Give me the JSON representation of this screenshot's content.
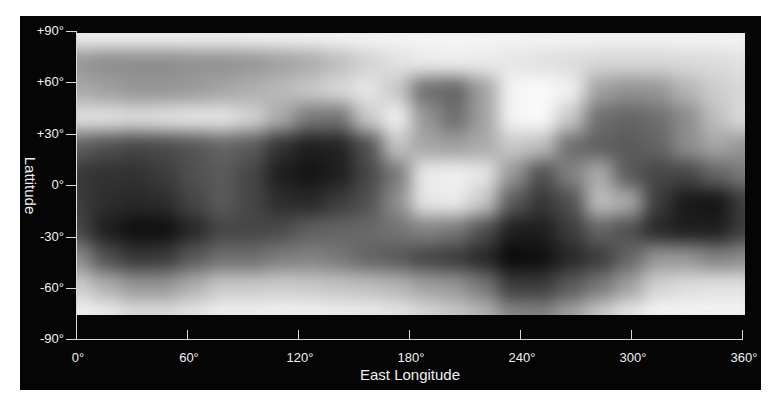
{
  "map": {
    "title_x": "East Longitude",
    "title_y": "Lattitude",
    "x_ticks": [
      "0°",
      "60°",
      "120°",
      "180°",
      "240°",
      "300°",
      "360°"
    ],
    "y_ticks": [
      "+90°",
      "+60°",
      "+30°",
      "0°",
      "-30°",
      "-60°",
      "-90°"
    ],
    "x_range": [
      0,
      360
    ],
    "y_range": [
      -90,
      90
    ],
    "colormap": "grayscale",
    "no_data_below_latitude": -75,
    "grid_cols": 24,
    "grid_rows": 11,
    "gray_values": [
      [
        245,
        245,
        245,
        245,
        245,
        245,
        245,
        245,
        245,
        245,
        245,
        245,
        245,
        245,
        245,
        245,
        245,
        245,
        245,
        245,
        245,
        245,
        245,
        245
      ],
      [
        150,
        140,
        140,
        140,
        145,
        145,
        150,
        160,
        170,
        190,
        210,
        225,
        235,
        238,
        235,
        230,
        225,
        220,
        215,
        215,
        215,
        218,
        220,
        225
      ],
      [
        170,
        160,
        150,
        150,
        155,
        165,
        175,
        185,
        200,
        215,
        230,
        200,
        110,
        100,
        160,
        245,
        250,
        240,
        160,
        145,
        150,
        180,
        205,
        215
      ],
      [
        225,
        225,
        220,
        225,
        230,
        230,
        210,
        170,
        120,
        115,
        200,
        240,
        150,
        110,
        160,
        245,
        250,
        200,
        110,
        100,
        110,
        140,
        190,
        220
      ],
      [
        95,
        80,
        70,
        75,
        85,
        100,
        90,
        50,
        30,
        35,
        80,
        195,
        165,
        160,
        170,
        200,
        190,
        110,
        95,
        90,
        100,
        140,
        165,
        150
      ],
      [
        55,
        50,
        50,
        60,
        80,
        90,
        70,
        30,
        20,
        30,
        70,
        120,
        235,
        240,
        230,
        150,
        80,
        130,
        170,
        90,
        70,
        70,
        100,
        120
      ],
      [
        60,
        45,
        40,
        45,
        70,
        90,
        70,
        45,
        40,
        60,
        80,
        140,
        230,
        235,
        200,
        90,
        55,
        80,
        190,
        170,
        60,
        25,
        20,
        60
      ],
      [
        70,
        30,
        15,
        15,
        40,
        70,
        70,
        75,
        95,
        100,
        105,
        115,
        130,
        120,
        80,
        30,
        30,
        60,
        100,
        80,
        40,
        30,
        30,
        60
      ],
      [
        140,
        80,
        55,
        60,
        90,
        110,
        110,
        125,
        130,
        120,
        100,
        90,
        70,
        60,
        40,
        10,
        15,
        40,
        60,
        100,
        150,
        150,
        130,
        140
      ],
      [
        205,
        175,
        150,
        150,
        175,
        200,
        200,
        205,
        200,
        195,
        190,
        180,
        160,
        150,
        120,
        60,
        60,
        90,
        120,
        160,
        210,
        220,
        225,
        225
      ],
      [
        245,
        235,
        220,
        220,
        230,
        240,
        240,
        242,
        242,
        238,
        235,
        230,
        215,
        200,
        180,
        135,
        130,
        160,
        200,
        230,
        245,
        245,
        245,
        245
      ]
    ]
  }
}
